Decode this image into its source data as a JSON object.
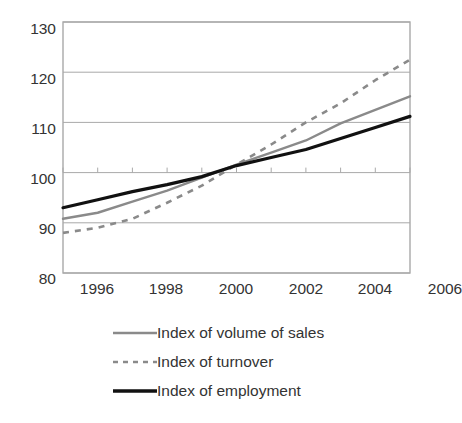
{
  "title_remnant": "(2000=100)",
  "chart_data": {
    "type": "line",
    "title": "",
    "subtitle": "",
    "xlabel": "",
    "ylabel": "",
    "x": [
      1996,
      1997,
      1998,
      1999,
      2000,
      2001,
      2002,
      2003,
      2004,
      2005,
      2006
    ],
    "categories": [
      "1996",
      "1997",
      "1998",
      "1999",
      "2000",
      "2001",
      "2002",
      "2003",
      "2004",
      "2005",
      "2006"
    ],
    "xlim": [
      1996,
      2006
    ],
    "ylim": [
      80,
      130
    ],
    "yticks": [
      80,
      90,
      100,
      110,
      120,
      130
    ],
    "xticks": [
      1996,
      1998,
      2000,
      2002,
      2004,
      2006
    ],
    "xtick_labels": [
      "1996",
      "1998",
      "2000",
      "2002",
      "2004",
      "2006"
    ],
    "ytick_labels": [
      "80",
      "90",
      "100",
      "110",
      "120",
      "130"
    ],
    "grid": "horizontal",
    "legend_position": "bottom",
    "series": [
      {
        "name": "Index of volume of sales",
        "style": "solid",
        "color": "#8a8a8a",
        "width": 2.4,
        "values": [
          90.8,
          92.0,
          94.2,
          96.4,
          99.0,
          101.6,
          104.0,
          106.4,
          109.8,
          112.5,
          115.2
        ]
      },
      {
        "name": "Index of turnover",
        "style": "dashed",
        "color": "#8a8a8a",
        "width": 2.6,
        "values": [
          88.0,
          89.0,
          90.8,
          94.0,
          97.4,
          101.6,
          105.6,
          110.0,
          113.8,
          118.4,
          122.5
        ]
      },
      {
        "name": "Index of employment",
        "style": "solid",
        "color": "#111111",
        "width": 3.2,
        "values": [
          93.0,
          94.6,
          96.2,
          97.6,
          99.2,
          101.4,
          103.0,
          104.6,
          106.8,
          109.0,
          111.2
        ]
      }
    ]
  },
  "legend": {
    "items": [
      {
        "label": "Index of volume of sales",
        "style": "solid",
        "color": "#8a8a8a",
        "width": 2.4
      },
      {
        "label": "Index of turnover",
        "style": "dashed",
        "color": "#8a8a8a",
        "width": 2.6
      },
      {
        "label": "Index of employment",
        "style": "solid",
        "color": "#111111",
        "width": 3.4
      }
    ]
  },
  "axes": {
    "frame_color": "#a9a9a9",
    "grid_color": "#a9a9a9"
  }
}
